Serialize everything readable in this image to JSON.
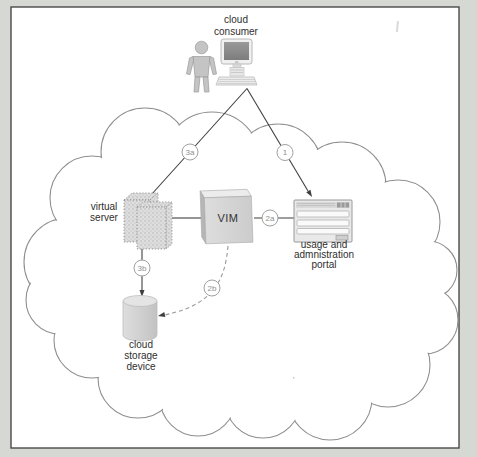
{
  "colors": {
    "page_background": "#d5d8d3",
    "panel_background": "#ffffff",
    "panel_border": "#4a4a4a",
    "cloud_outline": "#8f8f8f",
    "connector": "#3f3f3f",
    "dashed_connector": "#999999",
    "badge_border": "#a0a0a0",
    "badge_text": "#8f8f8f",
    "label_text": "#2e2e2e",
    "icon_gray": "#c9c9c9"
  },
  "nodes": {
    "cloud_consumer": {
      "label_lines": [
        "cloud",
        "consumer"
      ],
      "icons": [
        "person-icon",
        "workstation-icon"
      ]
    },
    "virtual_server": {
      "label_lines": [
        "virtual",
        "server"
      ],
      "icon": "virtual-server-icon"
    },
    "vim": {
      "label": "VIM",
      "icon": "vim-box-icon"
    },
    "usage_portal": {
      "label_lines": [
        "usage and",
        "admnistration",
        "portal"
      ],
      "icon": "portal-window-icon"
    },
    "cloud_storage": {
      "label_lines": [
        "cloud",
        "storage",
        "device"
      ],
      "icon": "storage-cylinder-icon"
    }
  },
  "edges": [
    {
      "badge": "3a",
      "from": "cloud-consumer",
      "to": "virtual-server",
      "style": "solid-arrow"
    },
    {
      "badge": "1",
      "from": "cloud-consumer",
      "to": "usage-portal",
      "style": "solid-arrow"
    },
    {
      "badge": "2a",
      "from": "vim",
      "to": "usage-portal",
      "style": "solid-line"
    },
    {
      "badge": "3b",
      "from": "virtual-server",
      "to": "cloud-storage",
      "style": "solid-arrow"
    },
    {
      "badge": "2b",
      "from": "vim",
      "to": "cloud-storage",
      "style": "dashed-arrow"
    }
  ]
}
